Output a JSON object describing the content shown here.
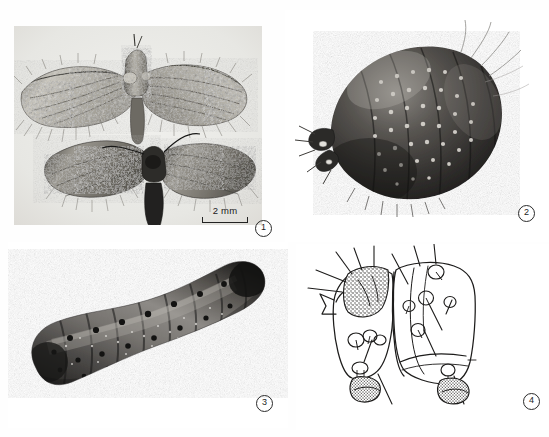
{
  "figure": {
    "background_color": "#ffffff",
    "caption": "",
    "panel_count": 4
  },
  "panels": [
    {
      "id": "panel-1",
      "number": "1",
      "kind": "photograph",
      "subject": "adult-moth-pair",
      "description": "Two pinned adult moths with mottled forewings, dorsal view on grey background",
      "background_color": "#e9e9e6",
      "scale_bar": {
        "label": "2 mm",
        "length_mm": 2
      }
    },
    {
      "id": "panel-2",
      "number": "2",
      "kind": "photograph",
      "subject": "pupa",
      "description": "Dark pupa in oblique view showing rows of dorsal spines",
      "background_color": "#ffffff"
    },
    {
      "id": "panel-3",
      "number": "3",
      "kind": "photograph",
      "subject": "larva",
      "description": "Curved segmented larva, dorsal view with dark setal pinacula",
      "background_color": "#ffffff"
    },
    {
      "id": "panel-4",
      "number": "4",
      "kind": "line-drawing",
      "subject": "larval-segments-chaetotaxy",
      "description": "Ink drawing of two abdominal segments with setae, pinacula and spiracles",
      "background_color": "#ffffff"
    }
  ],
  "labels": {
    "fignum_1": "1",
    "fignum_2": "2",
    "fignum_3": "3",
    "fignum_4": "4",
    "scale_label": "2 mm"
  }
}
